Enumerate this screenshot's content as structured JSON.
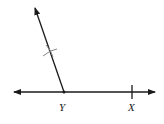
{
  "diagram": {
    "type": "geometry-construction",
    "points": [
      {
        "name": "Y",
        "label": "Y",
        "x": 64,
        "y": 92
      },
      {
        "name": "X",
        "label": "X",
        "x": 132,
        "y": 92
      }
    ],
    "line": {
      "description": "horizontal line through Y and X with arrows at both ends",
      "x1": 14,
      "x2": 155,
      "y": 92
    },
    "ray": {
      "description": "ray from Y pointing up-left",
      "from": [
        64,
        92
      ],
      "to": [
        35,
        8
      ]
    },
    "arc_mark": {
      "description": "compass arc crossing the ray",
      "x": 50,
      "y": 51
    },
    "colors": {
      "stroke": "#1a1a1a",
      "arc": "#888888",
      "background": "#ffffff"
    }
  }
}
